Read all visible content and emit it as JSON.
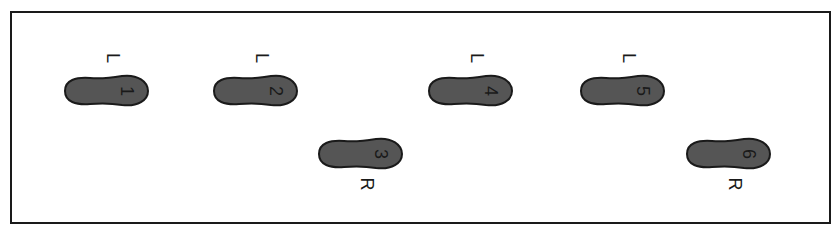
{
  "diagram": {
    "title": "",
    "footprint_color": "#555555",
    "outline_color": "#1a1a1a",
    "steps": [
      {
        "number": "1",
        "side": "L",
        "x": 62,
        "y": 74
      },
      {
        "number": "2",
        "side": "L",
        "x": 211,
        "y": 74
      },
      {
        "number": "3",
        "side": "R",
        "x": 316,
        "y": 137
      },
      {
        "number": "4",
        "side": "L",
        "x": 426,
        "y": 74
      },
      {
        "number": "5",
        "side": "L",
        "x": 578,
        "y": 74
      },
      {
        "number": "6",
        "side": "R",
        "x": 684,
        "y": 137
      }
    ]
  }
}
